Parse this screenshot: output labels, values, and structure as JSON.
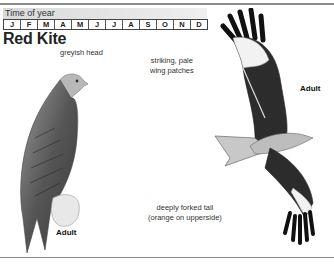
{
  "time_of_year": {
    "label": "Time of year",
    "months": [
      "J",
      "F",
      "M",
      "A",
      "M",
      "J",
      "J",
      "A",
      "S",
      "O",
      "N",
      "D"
    ]
  },
  "species": {
    "title": "Red Kite"
  },
  "perched_bird": {
    "annotation_head": "greyish head",
    "age_label": "Adult"
  },
  "flying_bird": {
    "annotation_wing_line1": "striking, pale",
    "annotation_wing_line2": "wing patches",
    "annotation_tail_line1": "deeply forked tail",
    "annotation_tail_line2": "(orange on upperside)",
    "age_label": "Adult"
  }
}
